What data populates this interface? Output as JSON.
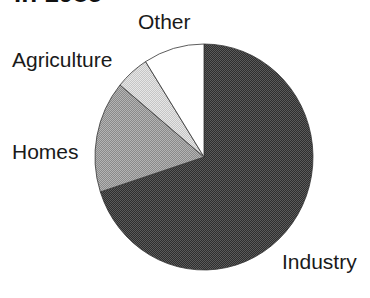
{
  "chart_data": {
    "type": "pie",
    "title": "in 1985",
    "title_clipped": true,
    "categories": [
      "Industry",
      "Homes",
      "Agriculture",
      "Other"
    ],
    "values": [
      70,
      16,
      5,
      9
    ],
    "units": "percent (estimated from slice angles)",
    "start_angle_deg": 0,
    "direction": "clockwise",
    "legend": "none (direct labels)",
    "colors": [
      "#3c3c3c",
      "#9c9c9c",
      "#d2d2d2",
      "#ffffff"
    ],
    "labels": {
      "industry": "Industry",
      "homes": "Homes",
      "agriculture": "Agriculture",
      "other": "Other"
    }
  }
}
